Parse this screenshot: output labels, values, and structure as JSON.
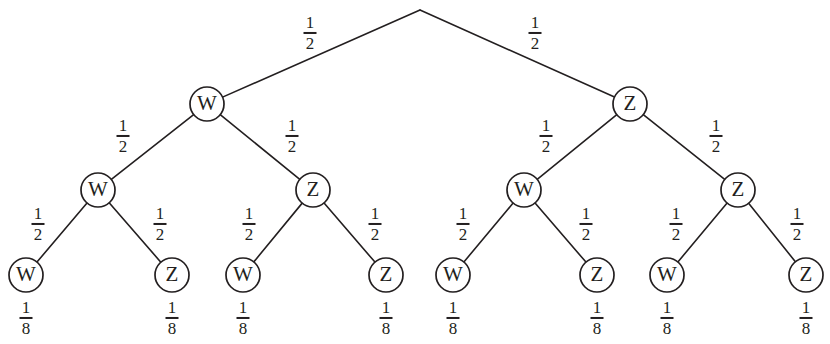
{
  "figure": {
    "type": "binary-probability-tree",
    "background_color": "#ffffff",
    "ink_color": "#231f20",
    "node_labels": [
      "W",
      "Z"
    ],
    "branch_probability": "1/2",
    "leaf_probability": "1/8",
    "depth": 3,
    "leaf_count": 8
  },
  "nodes": [
    {
      "id": "n-root",
      "label": "",
      "level": 0,
      "x": 420,
      "y": 10,
      "r": 0,
      "visible": false
    },
    {
      "id": "n-L",
      "label": "W",
      "level": 1,
      "x": 207,
      "y": 104,
      "r": 17,
      "visible": true
    },
    {
      "id": "n-R",
      "label": "Z",
      "level": 1,
      "x": 630,
      "y": 104,
      "r": 17,
      "visible": true
    },
    {
      "id": "n-LL",
      "label": "W",
      "level": 2,
      "x": 98,
      "y": 190,
      "r": 17,
      "visible": true
    },
    {
      "id": "n-LR",
      "label": "Z",
      "level": 2,
      "x": 313,
      "y": 190,
      "r": 17,
      "visible": true
    },
    {
      "id": "n-RL",
      "label": "W",
      "level": 2,
      "x": 524,
      "y": 190,
      "r": 17,
      "visible": true
    },
    {
      "id": "n-RR",
      "label": "Z",
      "level": 2,
      "x": 738,
      "y": 190,
      "r": 17,
      "visible": true
    },
    {
      "id": "n-LLL",
      "label": "W",
      "level": 3,
      "x": 26,
      "y": 275,
      "r": 17,
      "visible": true
    },
    {
      "id": "n-LLR",
      "label": "Z",
      "level": 3,
      "x": 172,
      "y": 275,
      "r": 17,
      "visible": true
    },
    {
      "id": "n-LRL",
      "label": "W",
      "level": 3,
      "x": 243,
      "y": 275,
      "r": 17,
      "visible": true
    },
    {
      "id": "n-LRR",
      "label": "Z",
      "level": 3,
      "x": 386,
      "y": 275,
      "r": 17,
      "visible": true
    },
    {
      "id": "n-RLL",
      "label": "W",
      "level": 3,
      "x": 453,
      "y": 275,
      "r": 17,
      "visible": true
    },
    {
      "id": "n-RLR",
      "label": "Z",
      "level": 3,
      "x": 597,
      "y": 275,
      "r": 17,
      "visible": true
    },
    {
      "id": "n-RRL",
      "label": "W",
      "level": 3,
      "x": 667,
      "y": 275,
      "r": 17,
      "visible": true
    },
    {
      "id": "n-RRR",
      "label": "Z",
      "level": 3,
      "x": 806,
      "y": 275,
      "r": 17,
      "visible": true
    }
  ],
  "edges": [
    {
      "id": "e-root-L",
      "from": "n-root",
      "to": "n-L",
      "label_num": "1",
      "label_den": "2",
      "label_x": 310,
      "label_y": 33
    },
    {
      "id": "e-root-R",
      "from": "n-root",
      "to": "n-R",
      "label_num": "1",
      "label_den": "2",
      "label_x": 535,
      "label_y": 33
    },
    {
      "id": "e-L-LL",
      "from": "n-L",
      "to": "n-LL",
      "label_num": "1",
      "label_den": "2",
      "label_x": 123,
      "label_y": 136
    },
    {
      "id": "e-L-LR",
      "from": "n-L",
      "to": "n-LR",
      "label_num": "1",
      "label_den": "2",
      "label_x": 292,
      "label_y": 136
    },
    {
      "id": "e-R-RL",
      "from": "n-R",
      "to": "n-RL",
      "label_num": "1",
      "label_den": "2",
      "label_x": 546,
      "label_y": 136
    },
    {
      "id": "e-R-RR",
      "from": "n-R",
      "to": "n-RR",
      "label_num": "1",
      "label_den": "2",
      "label_x": 716,
      "label_y": 136
    },
    {
      "id": "e-LL-LLL",
      "from": "n-LL",
      "to": "n-LLL",
      "label_num": "1",
      "label_den": "2",
      "label_x": 38,
      "label_y": 224
    },
    {
      "id": "e-LL-LLR",
      "from": "n-LL",
      "to": "n-LLR",
      "label_num": "1",
      "label_den": "2",
      "label_x": 160,
      "label_y": 224
    },
    {
      "id": "e-LR-LRL",
      "from": "n-LR",
      "to": "n-LRL",
      "label_num": "1",
      "label_den": "2",
      "label_x": 249,
      "label_y": 224
    },
    {
      "id": "e-LR-LRR",
      "from": "n-LR",
      "to": "n-LRR",
      "label_num": "1",
      "label_den": "2",
      "label_x": 375,
      "label_y": 224
    },
    {
      "id": "e-RL-RLL",
      "from": "n-RL",
      "to": "n-RLL",
      "label_num": "1",
      "label_den": "2",
      "label_x": 463,
      "label_y": 224
    },
    {
      "id": "e-RL-RLR",
      "from": "n-RL",
      "to": "n-RLR",
      "label_num": "1",
      "label_den": "2",
      "label_x": 586,
      "label_y": 224
    },
    {
      "id": "e-RR-RRL",
      "from": "n-RR",
      "to": "n-RRL",
      "label_num": "1",
      "label_den": "2",
      "label_x": 676,
      "label_y": 224
    },
    {
      "id": "e-RR-RRR",
      "from": "n-RR",
      "to": "n-RRR",
      "label_num": "1",
      "label_den": "2",
      "label_x": 797,
      "label_y": 224
    }
  ],
  "leaf_labels": [
    {
      "id": "lp-1",
      "for": "n-LLL",
      "num": "1",
      "den": "8",
      "x": 26,
      "y": 318
    },
    {
      "id": "lp-2",
      "for": "n-LLR",
      "num": "1",
      "den": "8",
      "x": 172,
      "y": 318
    },
    {
      "id": "lp-3",
      "for": "n-LRL",
      "num": "1",
      "den": "8",
      "x": 243,
      "y": 318
    },
    {
      "id": "lp-4",
      "for": "n-LRR",
      "num": "1",
      "den": "8",
      "x": 386,
      "y": 318
    },
    {
      "id": "lp-5",
      "for": "n-RLL",
      "num": "1",
      "den": "8",
      "x": 453,
      "y": 318
    },
    {
      "id": "lp-6",
      "for": "n-RLR",
      "num": "1",
      "den": "8",
      "x": 597,
      "y": 318
    },
    {
      "id": "lp-7",
      "for": "n-RRL",
      "num": "1",
      "den": "8",
      "x": 667,
      "y": 318
    },
    {
      "id": "lp-8",
      "for": "n-RRR",
      "num": "1",
      "den": "8",
      "x": 806,
      "y": 318
    }
  ]
}
